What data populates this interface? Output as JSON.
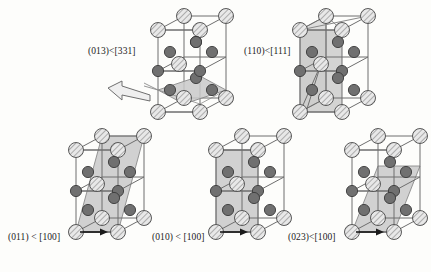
{
  "figure": {
    "name": "slip-systems-unit-cell-diagram",
    "background_color": "#fdfdfb",
    "ink_color": "#1b1b1b"
  },
  "style": {
    "corner_atom_fill": "#e8e8e8",
    "corner_atom_hatch": "#8c8c8c",
    "interior_atom_fill": "#707070",
    "interior_atom_stroke": "#3a3a3a",
    "edge_color": "#6e6e6e",
    "plane_fill": "#c9c9c9",
    "plane_stroke": "#8a8a8a",
    "arrow_outline_fill": "#efefef",
    "arrow_solid_fill": "#1b1b1b"
  },
  "cells": [
    {
      "id": "cell-013-331",
      "label": "(013)<[331]",
      "label_x": 88,
      "label_y": 46,
      "plane_indices": "(013)",
      "direction_indices": "[331]",
      "plane_type": "inclined-low-angle",
      "has_outline_arrow": true,
      "has_bottom_arrow": false,
      "origin_x": 144,
      "origin_y": 8
    },
    {
      "id": "cell-110-111",
      "label": "(110)<[111]",
      "label_x": 244,
      "label_y": 46,
      "plane_indices": "(110)",
      "direction_indices": "[111]",
      "plane_type": "vertical-diagonal",
      "has_outline_arrow": false,
      "has_bottom_arrow": false,
      "origin_x": 286,
      "origin_y": 8
    },
    {
      "id": "cell-011-100",
      "label": "(011) < [100]",
      "label_x": 8,
      "label_y": 232,
      "plane_indices": "(011)",
      "direction_indices": "[100]",
      "plane_type": "steep-shear",
      "has_outline_arrow": false,
      "has_bottom_arrow": true,
      "origin_x": 62,
      "origin_y": 128
    },
    {
      "id": "cell-010-100",
      "label": "(010) < [100]",
      "label_x": 152,
      "label_y": 232,
      "plane_indices": "(010)",
      "direction_indices": "[100]",
      "plane_type": "vertical-face",
      "has_outline_arrow": false,
      "has_bottom_arrow": true,
      "origin_x": 202,
      "origin_y": 128
    },
    {
      "id": "cell-023-100",
      "label": "(023)<[100]",
      "label_x": 288,
      "label_y": 232,
      "plane_indices": "(023)",
      "direction_indices": "[100]",
      "plane_type": "medium-shear",
      "has_outline_arrow": false,
      "has_bottom_arrow": true,
      "origin_x": 338,
      "origin_y": 128
    }
  ]
}
